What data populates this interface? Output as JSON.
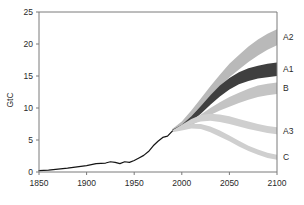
{
  "chart_data": {
    "type": "area",
    "title": "",
    "xlabel": "",
    "ylabel": "GtC",
    "xlim": [
      1850,
      2100
    ],
    "ylim": [
      0,
      25
    ],
    "xticks": [
      1850,
      1900,
      1950,
      2000,
      2050,
      2100
    ],
    "yticks": [
      0,
      5,
      10,
      15,
      20,
      25
    ],
    "grid": false,
    "legend_position": "right-edge-inline",
    "historical": {
      "name": "Historical emissions",
      "color": "#141414",
      "x": [
        1850,
        1860,
        1870,
        1880,
        1890,
        1900,
        1910,
        1920,
        1925,
        1930,
        1935,
        1940,
        1945,
        1950,
        1955,
        1960,
        1965,
        1970,
        1975,
        1980,
        1985,
        1990
      ],
      "y": [
        0.2,
        0.3,
        0.45,
        0.6,
        0.8,
        1.0,
        1.3,
        1.4,
        1.6,
        1.5,
        1.3,
        1.6,
        1.5,
        1.8,
        2.2,
        2.6,
        3.2,
        4.1,
        4.8,
        5.4,
        5.6,
        6.4
      ]
    },
    "series": [
      {
        "name": "A2",
        "label": "A2",
        "color": "#b9b9b9",
        "x": [
          1990,
          2000,
          2010,
          2020,
          2030,
          2040,
          2050,
          2060,
          2070,
          2080,
          2090,
          2100
        ],
        "upper": [
          6.7,
          7.9,
          9.6,
          11.5,
          13.4,
          15.2,
          16.9,
          18.3,
          19.6,
          20.7,
          21.6,
          22.3
        ],
        "lower": [
          6.5,
          7.3,
          8.7,
          10.3,
          11.9,
          13.4,
          14.8,
          16.0,
          17.2,
          18.2,
          19.1,
          19.8
        ]
      },
      {
        "name": "A1",
        "label": "A1",
        "color": "#3f3f3f",
        "x": [
          1990,
          2000,
          2010,
          2020,
          2030,
          2040,
          2050,
          2060,
          2070,
          2080,
          2090,
          2100
        ],
        "upper": [
          6.6,
          7.4,
          8.7,
          10.3,
          12.0,
          13.5,
          14.7,
          15.6,
          16.2,
          16.6,
          16.9,
          17.1
        ],
        "lower": [
          6.4,
          6.9,
          7.9,
          9.1,
          10.5,
          11.8,
          12.9,
          13.7,
          14.2,
          14.6,
          14.8,
          15.0
        ]
      },
      {
        "name": "B",
        "label": "B",
        "color": "#c4c4c4",
        "x": [
          1990,
          2000,
          2010,
          2020,
          2030,
          2040,
          2050,
          2060,
          2070,
          2080,
          2090,
          2100
        ],
        "upper": [
          6.5,
          7.1,
          8.0,
          9.0,
          10.0,
          10.9,
          11.7,
          12.4,
          13.0,
          13.5,
          13.8,
          14.0
        ],
        "lower": [
          6.3,
          6.7,
          7.3,
          8.1,
          8.9,
          9.6,
          10.2,
          10.8,
          11.3,
          11.7,
          12.0,
          12.2
        ]
      },
      {
        "name": "A3",
        "label": "A3",
        "color": "#cfcfcf",
        "x": [
          1990,
          2000,
          2010,
          2020,
          2030,
          2040,
          2050,
          2060,
          2070,
          2080,
          2090,
          2100
        ],
        "upper": [
          6.5,
          7.4,
          8.3,
          8.9,
          9.1,
          9.0,
          8.7,
          8.3,
          7.9,
          7.5,
          7.2,
          7.0
        ],
        "lower": [
          6.3,
          6.9,
          7.5,
          7.9,
          8.0,
          7.8,
          7.5,
          7.1,
          6.7,
          6.4,
          6.1,
          5.9
        ]
      },
      {
        "name": "C",
        "label": "C",
        "color": "#cfcfcf",
        "x": [
          1990,
          2000,
          2010,
          2020,
          2030,
          2040,
          2050,
          2060,
          2070,
          2080,
          2090,
          2100
        ],
        "upper": [
          6.4,
          7.0,
          7.5,
          7.5,
          7.1,
          6.5,
          5.7,
          4.9,
          4.1,
          3.5,
          3.0,
          2.7
        ],
        "lower": [
          6.2,
          6.5,
          6.8,
          6.7,
          6.2,
          5.5,
          4.8,
          4.0,
          3.3,
          2.7,
          2.2,
          1.9
        ]
      }
    ]
  },
  "axes": {
    "y_title": "GtC",
    "x_tick_labels": [
      "1850",
      "1900",
      "1950",
      "2000",
      "2050",
      "2100"
    ],
    "y_tick_labels": [
      "0",
      "5",
      "10",
      "15",
      "20",
      "25"
    ]
  },
  "band_labels": [
    "A2",
    "A1",
    "B",
    "A3",
    "C"
  ]
}
